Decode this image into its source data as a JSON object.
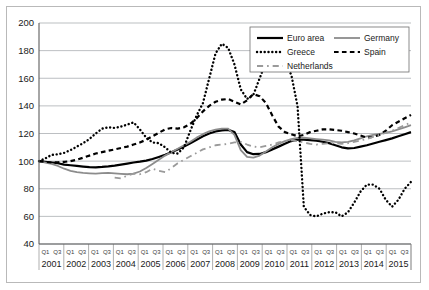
{
  "chart_data": {
    "type": "line",
    "title": "",
    "xlabel": "",
    "ylabel": "",
    "ylim": [
      40,
      200
    ],
    "yticks": [
      40,
      60,
      80,
      100,
      120,
      140,
      160,
      180,
      200
    ],
    "grid": true,
    "legend_position": "top-right",
    "years": [
      "2001",
      "2002",
      "2003",
      "2004",
      "2005",
      "2006",
      "2007",
      "2008",
      "2009",
      "2010",
      "2011",
      "2012",
      "2013",
      "2014",
      "2015"
    ],
    "quarter_labels": [
      "Q1",
      "Q3"
    ],
    "x": [
      "2001Q1",
      "2001Q2",
      "2001Q3",
      "2001Q4",
      "2002Q1",
      "2002Q2",
      "2002Q3",
      "2002Q4",
      "2003Q1",
      "2003Q2",
      "2003Q3",
      "2003Q4",
      "2004Q1",
      "2004Q2",
      "2004Q3",
      "2004Q4",
      "2005Q1",
      "2005Q2",
      "2005Q3",
      "2005Q4",
      "2006Q1",
      "2006Q2",
      "2006Q3",
      "2006Q4",
      "2007Q1",
      "2007Q2",
      "2007Q3",
      "2007Q4",
      "2008Q1",
      "2008Q2",
      "2008Q3",
      "2008Q4",
      "2009Q1",
      "2009Q2",
      "2009Q3",
      "2009Q4",
      "2010Q1",
      "2010Q2",
      "2010Q3",
      "2010Q4",
      "2011Q1",
      "2011Q2",
      "2011Q3",
      "2011Q4",
      "2012Q1",
      "2012Q2",
      "2012Q3",
      "2012Q4",
      "2013Q1",
      "2013Q2",
      "2013Q3",
      "2013Q4",
      "2014Q1",
      "2014Q2",
      "2014Q3",
      "2014Q4",
      "2015Q1",
      "2015Q2",
      "2015Q3",
      "2015Q4"
    ],
    "series": [
      {
        "name": "Euro area",
        "style": "solid",
        "color": "#000000",
        "width": 2.2,
        "values": [
          100,
          99.5,
          99,
          98.5,
          97.5,
          97,
          96.5,
          96,
          95.6,
          95.5,
          95.8,
          96.2,
          96.8,
          97.5,
          98.2,
          99,
          99.6,
          100.4,
          101.5,
          103,
          104.6,
          106.4,
          108.4,
          110.5,
          113,
          115.5,
          118,
          120,
          121.5,
          122.3,
          122.6,
          121,
          112,
          106.5,
          105,
          105.2,
          106.5,
          108.5,
          110.5,
          112.5,
          114.5,
          115.5,
          115.6,
          115.2,
          114.8,
          114,
          113,
          111.5,
          110,
          109.2,
          109.5,
          110.5,
          111.5,
          112.8,
          114,
          115.2,
          116.5,
          118,
          119.5,
          121
        ]
      },
      {
        "name": "Germany",
        "style": "solid-gray",
        "color": "#8c8c8c",
        "width": 1.8,
        "values": [
          100,
          99,
          98,
          96.5,
          94.5,
          93,
          92,
          91.5,
          91.2,
          91,
          91.3,
          91.5,
          91.2,
          90.8,
          90.5,
          91,
          92.5,
          95,
          98,
          101,
          104,
          106.5,
          109,
          111.5,
          114,
          117,
          119.5,
          121.5,
          122.8,
          123.5,
          123.6,
          119,
          108,
          103,
          102.5,
          104,
          107,
          110,
          112.5,
          114.5,
          116,
          116.8,
          117,
          116.5,
          116,
          115.5,
          115,
          114,
          113.5,
          114,
          115,
          116.5,
          118,
          119,
          119.8,
          120.5,
          121.5,
          123,
          124.5,
          126
        ]
      },
      {
        "name": "Greece",
        "style": "dotted",
        "color": "#000000",
        "width": 2.4,
        "values": [
          100,
          102,
          104.5,
          105,
          106,
          108,
          110.5,
          113,
          116,
          120,
          123.5,
          124.5,
          124,
          125,
          126.5,
          128,
          123,
          117,
          113.5,
          113,
          110,
          106,
          105.5,
          110,
          122,
          133,
          142,
          160,
          178,
          185,
          182,
          170,
          152,
          145,
          148,
          160,
          172,
          178,
          175,
          168,
          163,
          140,
          131,
          132,
          138,
          148,
          152,
          140,
          128,
          122,
          120,
          110,
          99,
          90,
          76,
          65,
          60.5,
          58,
          58.5,
          60
        ],
        "values_tail": [
          67,
          61,
          60,
          62,
          63,
          63,
          60,
          63,
          70,
          78,
          83,
          83,
          80,
          72,
          67,
          72,
          80,
          85
        ]
      },
      {
        "name": "Spain",
        "style": "dashed",
        "color": "#000000",
        "width": 2.2,
        "values": [
          100,
          99.5,
          99,
          99.2,
          99.5,
          100,
          101,
          102.5,
          104,
          105.5,
          106.5,
          107.5,
          108.5,
          109.5,
          110.5,
          112,
          113.5,
          115.5,
          118,
          120.5,
          123,
          124,
          123.5,
          124.5,
          127,
          131,
          136,
          140,
          143,
          144.5,
          145,
          143,
          141,
          144,
          148.5,
          147,
          142,
          133,
          125,
          121,
          119.5,
          118,
          119,
          121,
          122,
          123,
          123,
          122.5,
          122,
          121,
          120,
          118.5,
          117,
          117.5,
          119,
          122,
          126,
          128.5,
          131,
          133.5
        ]
      },
      {
        "name": "Netherlands",
        "style": "dashdot",
        "color": "#9a9a9a",
        "width": 1.8,
        "starts_at_index": 12,
        "values": [
          null,
          null,
          null,
          null,
          null,
          null,
          null,
          null,
          null,
          null,
          null,
          null,
          88,
          87.5,
          89.5,
          91,
          90.5,
          92,
          94.5,
          93,
          92,
          95,
          98.5,
          101,
          103.5,
          106,
          108.5,
          110,
          111.5,
          112,
          112.5,
          113.5,
          114,
          112,
          110.5,
          110,
          111,
          112,
          113.5,
          114.5,
          115,
          114.5,
          113.5,
          112.5,
          112,
          112.5,
          113,
          113,
          112.5,
          113,
          114,
          115,
          116,
          117.5,
          119,
          120.5,
          122,
          124,
          126,
          128
        ]
      }
    ],
    "annotations": {
      "greece_peak_2008": 185,
      "greece_trough_2012": 58,
      "greece_end_2015": 85,
      "spain_end_2015": 144,
      "netherlands_end_2015": 135,
      "germany_end_2015": 126,
      "euro_area_end_2015": 121
    }
  },
  "legend": {
    "items": [
      {
        "label": "Euro area",
        "key": "euro-area"
      },
      {
        "label": "Germany",
        "key": "germany"
      },
      {
        "label": "Greece",
        "key": "greece"
      },
      {
        "label": "Spain",
        "key": "spain"
      },
      {
        "label": "Netherlands",
        "key": "netherlands"
      }
    ]
  }
}
